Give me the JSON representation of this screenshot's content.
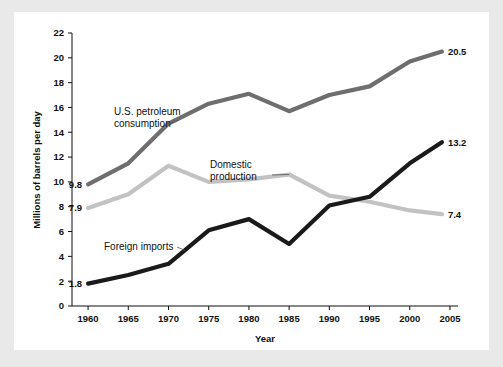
{
  "chart_data": {
    "type": "line",
    "title": "",
    "xlabel": "Year",
    "ylabel": "Millions of barrels per day",
    "xlim": [
      1958,
      2006
    ],
    "ylim": [
      0,
      22
    ],
    "grid": false,
    "legend_position": "inline-annotations",
    "x": [
      1960,
      1965,
      1970,
      1975,
      1980,
      1985,
      1990,
      1995,
      2000,
      2004
    ],
    "xticks": [
      "1960",
      "1965",
      "1970",
      "1975",
      "1980",
      "1985",
      "1990",
      "1995",
      "2000",
      "2005"
    ],
    "xtick_values": [
      1960,
      1965,
      1970,
      1975,
      1980,
      1985,
      1990,
      1995,
      2000,
      2005
    ],
    "yticks": [
      "0",
      "2",
      "4",
      "6",
      "8",
      "10",
      "12",
      "14",
      "16",
      "18",
      "20",
      "22"
    ],
    "ytick_values": [
      0,
      2,
      4,
      6,
      8,
      10,
      12,
      14,
      16,
      18,
      20,
      22
    ],
    "series": [
      {
        "name": "U.S. petroleum consumption",
        "color": "#6e6e6e",
        "values": [
          9.8,
          11.5,
          14.7,
          16.3,
          17.1,
          15.7,
          17.0,
          17.7,
          19.7,
          20.5
        ],
        "start_label": "9.8",
        "end_label": "20.5"
      },
      {
        "name": "Domestic production",
        "color": "#c2c2c2",
        "values": [
          7.9,
          9.0,
          11.3,
          10.0,
          10.2,
          10.6,
          8.9,
          8.4,
          7.7,
          7.4
        ],
        "start_label": "7.9",
        "end_label": "7.4"
      },
      {
        "name": "Foreign imports",
        "color": "#1a1a1a",
        "values": [
          1.8,
          2.5,
          3.4,
          6.1,
          7.0,
          5.0,
          8.1,
          8.8,
          11.5,
          13.2
        ],
        "start_label": "1.8",
        "end_label": "13.2"
      }
    ],
    "annotations": [
      {
        "id": "consumption",
        "line1": "U.S. petroleum",
        "line2": "consumption",
        "target_year": 1970,
        "target_value": 14.7
      },
      {
        "id": "production",
        "line1": "Domestic",
        "line2": "production",
        "target_year": 1985,
        "target_value": 10.6
      },
      {
        "id": "imports",
        "line1": "Foreign imports",
        "line2": "",
        "target_year": 1972,
        "target_value": 4.5
      }
    ]
  },
  "colors": {
    "page_background": "#e9e9e9",
    "panel_background": "#ffffff",
    "axis": "#111111",
    "consumption": "#6e6e6e",
    "production": "#c2c2c2",
    "imports": "#1a1a1a"
  }
}
